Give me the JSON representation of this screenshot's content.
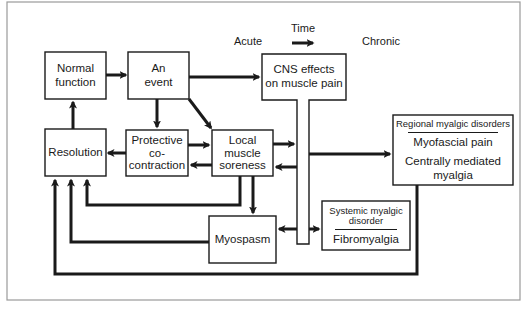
{
  "diagram": {
    "title_labels": {
      "acute": "Acute",
      "time": "Time",
      "chronic": "Chronic"
    },
    "nodes": {
      "normal_function": {
        "line1": "Normal",
        "line2": "function"
      },
      "an_event": {
        "line1": "An",
        "line2": "event"
      },
      "cns_effects": {
        "line1": "CNS effects",
        "line2": "on muscle pain"
      },
      "resolution": {
        "line1": "Resolution"
      },
      "protective_cocontraction": {
        "line1": "Protective",
        "line2": "co-",
        "line3": "contraction"
      },
      "local_muscle_soreness": {
        "line1": "Local",
        "line2": "muscle",
        "line3": "soreness"
      },
      "myospasm": {
        "line1": "Myospasm"
      },
      "regional_myalgic": {
        "header": "Regional myalgic disorders",
        "item1": "Myofascial pain",
        "item2": "Centrally mediated myalgia"
      },
      "systemic_myalgic": {
        "header_line1": "Systemic myalgic",
        "header_line2": "disorder",
        "item1": "Fibromyalgia"
      }
    },
    "edges": [
      {
        "from": "Normal function",
        "to": "An event"
      },
      {
        "from": "An event",
        "to": "CNS effects on muscle pain"
      },
      {
        "from": "An event",
        "to": "Protective co-contraction"
      },
      {
        "from": "An event",
        "to": "Local muscle soreness"
      },
      {
        "from": "Protective co-contraction",
        "to": "Resolution"
      },
      {
        "from": "Protective co-contraction",
        "to": "Local muscle soreness"
      },
      {
        "from": "Local muscle soreness",
        "to": "Protective co-contraction"
      },
      {
        "from": "Local muscle soreness",
        "to": "CNS effects on muscle pain"
      },
      {
        "from": "CNS effects on muscle pain",
        "to": "Local muscle soreness"
      },
      {
        "from": "Local muscle soreness",
        "to": "Myospasm"
      },
      {
        "from": "Local muscle soreness",
        "to": "Resolution"
      },
      {
        "from": "Myospasm",
        "to": "Resolution"
      },
      {
        "from": "CNS effects on muscle pain",
        "to": "Myospasm"
      },
      {
        "from": "CNS effects on muscle pain",
        "to": "Regional myalgic disorders"
      },
      {
        "from": "CNS effects on muscle pain",
        "to": "Systemic myalgic disorder"
      },
      {
        "from": "Regional myalgic disorders",
        "to": "Resolution"
      },
      {
        "from": "Resolution",
        "to": "Normal function"
      }
    ],
    "colors": {
      "line": "#1a1a1a",
      "frame": "#9a9a9a",
      "background": "#ffffff"
    }
  }
}
